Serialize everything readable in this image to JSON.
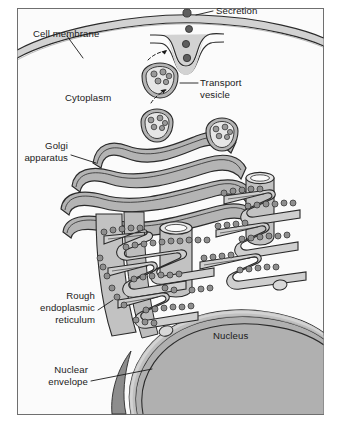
{
  "figure": {
    "frame": {
      "x": 17,
      "y": 8,
      "width": 307,
      "height": 407,
      "border_color": "#6f6f6f",
      "fill": "#fbfbfb"
    },
    "palette": {
      "outline": "#2b2b2b",
      "cytoplasm": "#fbfbfb",
      "organelle_fill": "#b4b4b4",
      "organelle_light": "#cfcfcf",
      "organelle_lumen": "#e6e6e6",
      "nucleus_fill": "#b0b0b0",
      "nucleus_dark": "#8d8d8d",
      "membrane_fill": "#d2d2d2",
      "ribosome_fill": "#8f8f8f",
      "secretion_fill": "#5e5e5e",
      "leader": "#1a1a1a"
    }
  },
  "labels": {
    "cell_membrane": "Cell membrane",
    "cytoplasm": "Cytoplasm",
    "secretion": "Secretion",
    "transport_vesicle_line1": "Transport",
    "transport_vesicle_line2": "vesicle",
    "golgi_line1": "Golgi",
    "golgi_line2": "apparatus",
    "rough_er_line1": "Rough",
    "rough_er_line2": "endoplasmic",
    "rough_er_line3": "reticulum",
    "nucleus": "Nucleus",
    "nuclear_envelope_line1": "Nuclear",
    "nuclear_envelope_line2": "envelope"
  },
  "structures": {
    "secretion_granules": 4,
    "transport_vesicles": 2,
    "golgi_cisternae": 5,
    "er_tubules": 3,
    "ribosomes_visible": 64
  }
}
